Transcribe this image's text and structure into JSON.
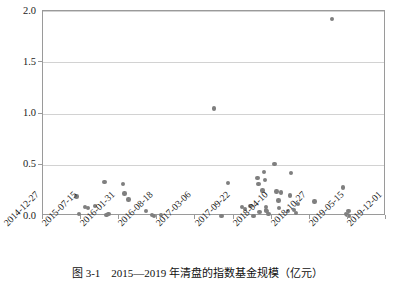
{
  "caption": "图 3-1　2015—2019 年清盘的指数基金规模（亿元）",
  "chart_data": {
    "type": "scatter",
    "title": "图 3-1　2015—2019 年清盘的指数基金规模（亿元）",
    "xlabel": "",
    "ylabel": "",
    "unit": "亿元",
    "grid": true,
    "legend": false,
    "marker_color": "#7f7f7f",
    "frame_color": "#9a9a9a",
    "gridline_color": "#d2d2d2",
    "ylim": [
      0.0,
      2.0
    ],
    "yticks": [
      0.0,
      0.5,
      1.0,
      1.5,
      2.0
    ],
    "ytick_labels": [
      "0.0",
      "0.5",
      "1.0",
      "1.5",
      "2.0"
    ],
    "xlim": [
      "2014-12-27",
      "2019-12-01"
    ],
    "xticks": [
      "2014-12-27",
      "2015-07-15",
      "2016-01-31",
      "2016-08-18",
      "2017-03-06",
      "2017-09-22",
      "2018-04-10",
      "2018-10-27",
      "2019-05-15",
      "2019-12-01"
    ],
    "xtick_labels": [
      "2014-12-27",
      "2015-07-15",
      "2016-01-31",
      "2016-08-18",
      "2017-03-06",
      "2017-09-22",
      "2018-04-10",
      "2018-10-27",
      "2019-05-15",
      "2019-12-01"
    ],
    "points": [
      {
        "x": "2015-06-20",
        "y": 0.19
      },
      {
        "x": "2015-07-05",
        "y": 0.02
      },
      {
        "x": "2015-08-05",
        "y": 0.09
      },
      {
        "x": "2015-08-20",
        "y": 0.08
      },
      {
        "x": "2015-09-25",
        "y": 0.1
      },
      {
        "x": "2015-11-15",
        "y": 0.33
      },
      {
        "x": "2015-11-25",
        "y": 0.01
      },
      {
        "x": "2015-12-05",
        "y": 0.02
      },
      {
        "x": "2016-02-20",
        "y": 0.31
      },
      {
        "x": "2016-02-28",
        "y": 0.22
      },
      {
        "x": "2016-03-20",
        "y": 0.16
      },
      {
        "x": "2016-06-20",
        "y": 0.05
      },
      {
        "x": "2016-07-20",
        "y": 0.01
      },
      {
        "x": "2016-07-30",
        "y": 0.0
      },
      {
        "x": "2016-09-05",
        "y": 0.01
      },
      {
        "x": "2017-07-20",
        "y": 0.0
      },
      {
        "x": "2017-08-25",
        "y": 0.32
      },
      {
        "x": "2017-11-05",
        "y": 0.09
      },
      {
        "x": "2017-11-20",
        "y": 0.07
      },
      {
        "x": "2017-12-20",
        "y": 0.1
      },
      {
        "x": "2018-01-05",
        "y": 0.0
      },
      {
        "x": "2018-01-25",
        "y": 0.37
      },
      {
        "x": "2018-01-30",
        "y": 0.31
      },
      {
        "x": "2018-02-05",
        "y": 0.04
      },
      {
        "x": "2018-02-20",
        "y": 0.25
      },
      {
        "x": "2018-02-28",
        "y": 0.43
      },
      {
        "x": "2018-03-05",
        "y": 0.35
      },
      {
        "x": "2018-03-10",
        "y": 0.09
      },
      {
        "x": "2018-03-12",
        "y": 0.06
      },
      {
        "x": "2018-03-14",
        "y": 0.05
      },
      {
        "x": "2018-03-25",
        "y": 0.02
      },
      {
        "x": "2018-04-25",
        "y": 0.51
      },
      {
        "x": "2018-05-05",
        "y": 0.24
      },
      {
        "x": "2018-05-15",
        "y": 0.15
      },
      {
        "x": "2018-05-20",
        "y": 0.08
      },
      {
        "x": "2018-05-30",
        "y": 0.23
      },
      {
        "x": "2018-07-05",
        "y": 0.05
      },
      {
        "x": "2018-07-15",
        "y": 0.2
      },
      {
        "x": "2018-07-20",
        "y": 0.42
      },
      {
        "x": "2018-08-05",
        "y": 0.06
      },
      {
        "x": "2018-08-15",
        "y": 0.03
      },
      {
        "x": "2018-08-25",
        "y": 0.12
      },
      {
        "x": "2018-11-20",
        "y": 0.14
      },
      {
        "x": "2019-02-20",
        "y": 1.92
      },
      {
        "x": "2019-04-20",
        "y": 0.28
      },
      {
        "x": "2019-05-05",
        "y": 0.02
      },
      {
        "x": "2019-05-12",
        "y": 0.01
      },
      {
        "x": "2019-05-18",
        "y": 0.05
      },
      {
        "x": "2019-05-20",
        "y": 0.0
      },
      {
        "x": "2017-06-10",
        "y": 1.05
      }
    ]
  }
}
